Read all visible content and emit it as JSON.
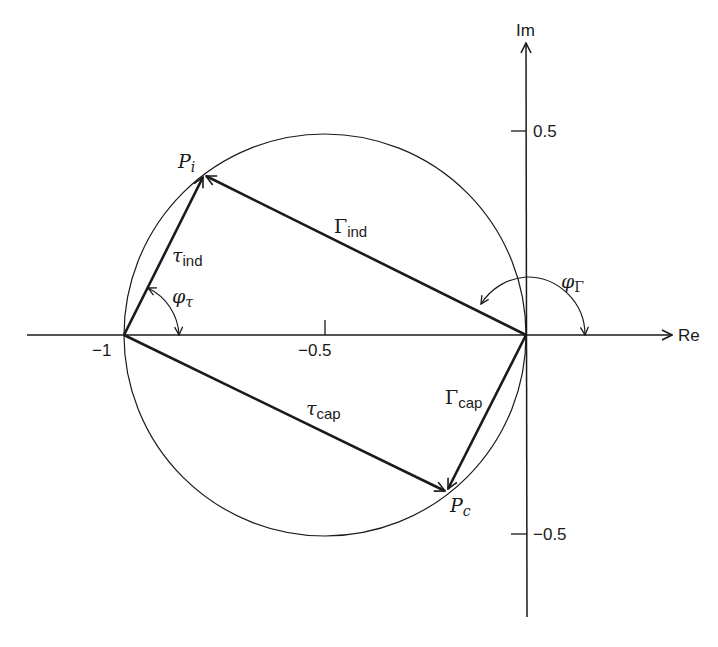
{
  "diagram": {
    "type": "complex-plane-phasor-diagram",
    "axes": {
      "real_label": "Re",
      "imag_label": "Im",
      "origin_px": [
        526,
        335
      ],
      "px_per_unit": 402,
      "real_ticks": [
        {
          "value": -1,
          "label": "−1"
        },
        {
          "value": -0.5,
          "label": "−0.5"
        }
      ],
      "imag_ticks": [
        {
          "value": 0.5,
          "label": "0.5"
        },
        {
          "value": -0.5,
          "label": "−0.5"
        }
      ]
    },
    "circle": {
      "center": [
        -0.5,
        0
      ],
      "radius": 0.5
    },
    "points": {
      "Pi": {
        "label_main": "P",
        "label_sub": "i",
        "re": -0.8,
        "im": 0.4
      },
      "Pc": {
        "label_main": "P",
        "label_sub": "c",
        "re": -0.2,
        "im": -0.39
      },
      "minus_one": {
        "re": -1,
        "im": 0
      },
      "origin": {
        "re": 0,
        "im": 0
      }
    },
    "vectors": [
      {
        "name": "Gamma_ind",
        "from": "origin",
        "to": "Pi",
        "label_main": "Γ",
        "label_sub": "ind"
      },
      {
        "name": "tau_ind",
        "from": "minus_one",
        "to": "Pi",
        "label_main": "τ",
        "label_sub": "ind"
      },
      {
        "name": "tau_cap",
        "from": "minus_one",
        "to": "Pc",
        "label_main": "τ",
        "label_sub": "cap"
      },
      {
        "name": "Gamma_cap",
        "from": "origin",
        "to": "Pc",
        "label_main": "Γ",
        "label_sub": "cap"
      }
    ],
    "angles": [
      {
        "name": "phi_tau",
        "label_main": "φ",
        "label_sub": "τ",
        "vertex": "minus_one"
      },
      {
        "name": "phi_Gamma",
        "label_main": "φ",
        "label_sub": "Γ",
        "vertex": "origin"
      }
    ]
  }
}
